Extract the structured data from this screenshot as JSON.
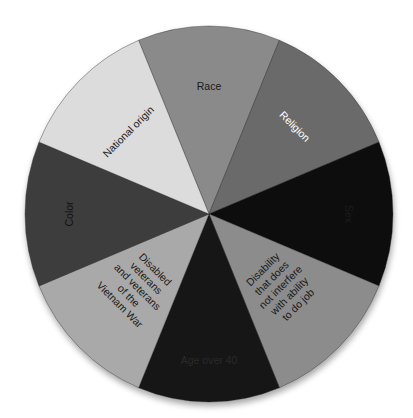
{
  "chart_data": {
    "type": "pie",
    "title": "",
    "categories": [
      "Race",
      "Religion",
      "Sex",
      "Disability that does not interfere with ability to do job",
      "Age over 40",
      "Disabled veterans and veterans of the Vietnam War",
      "Color",
      "National origin"
    ],
    "values": [
      12.5,
      12.5,
      12.5,
      12.5,
      12.5,
      12.5,
      12.5,
      12.5
    ],
    "legend": "none (labels inside slices)"
  },
  "slices": [
    {
      "label_lines": [
        "Race"
      ],
      "color": "#8a8a8a",
      "text_color": "#1a1a1a"
    },
    {
      "label_lines": [
        "Religion"
      ],
      "color": "#6b6b6b",
      "text_color": "#ffffff"
    },
    {
      "label_lines": [
        "Sex"
      ],
      "color": "#0d0d0d",
      "text_color": "#1c1c1c"
    },
    {
      "label_lines": [
        "Disability",
        "that does",
        "not interfere",
        "with ability",
        "to do job"
      ],
      "color": "#8c8c8c",
      "text_color": "#1a1a1a"
    },
    {
      "label_lines": [
        "Age over 40"
      ],
      "color": "#151515",
      "text_color": "#2a2a2a"
    },
    {
      "label_lines": [
        "Disabled",
        "veterans",
        "and veterans",
        "of the",
        "Vietnam War"
      ],
      "color": "#a9a9a9",
      "text_color": "#1a1a1a"
    },
    {
      "label_lines": [
        "Color"
      ],
      "color": "#3e3e3e",
      "text_color": "#111111"
    },
    {
      "label_lines": [
        "National origin"
      ],
      "color": "#dcdcdc",
      "text_color": "#222222"
    }
  ]
}
